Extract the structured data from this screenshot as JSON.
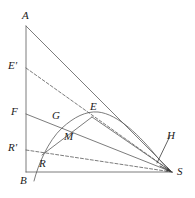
{
  "figure": {
    "type": "geometry-diagram",
    "title": "",
    "canvas": {
      "width": 195,
      "height": 198
    },
    "style": {
      "stroke_color": "#5a5a5a",
      "stroke_color_dark": "#3c3c3c",
      "label_color": "#1a1a1a",
      "background": "#ffffff",
      "stroke_width": 0.8,
      "dash_pattern": "3,2"
    },
    "points": [
      {
        "name": "A",
        "label": "A",
        "x": 26,
        "y": 26,
        "label_x": 22,
        "label_y": 10
      },
      {
        "name": "E'",
        "label": "E'",
        "x": 26,
        "y": 68,
        "label_x": 8,
        "label_y": 60
      },
      {
        "name": "F",
        "label": "F",
        "x": 26,
        "y": 114,
        "label_x": 11,
        "label_y": 106
      },
      {
        "name": "G",
        "label": "G",
        "x": 62,
        "y": 124,
        "label_x": 52,
        "label_y": 110
      },
      {
        "name": "E",
        "label": "E",
        "x": 92,
        "y": 117,
        "label_x": 90,
        "label_y": 101
      },
      {
        "name": "M",
        "label": "M",
        "x": 74,
        "y": 139,
        "label_x": 64,
        "label_y": 131
      },
      {
        "name": "R'",
        "label": "R'",
        "x": 26,
        "y": 150,
        "label_x": 8,
        "label_y": 142
      },
      {
        "name": "R",
        "label": "R",
        "x": 42,
        "y": 155,
        "label_x": 39,
        "label_y": 158
      },
      {
        "name": "B",
        "label": "B",
        "x": 26,
        "y": 172,
        "label_x": 20,
        "label_y": 175
      },
      {
        "name": "H",
        "label": "H",
        "x": 158,
        "y": 162,
        "label_x": 167,
        "label_y": 130
      },
      {
        "name": "S",
        "label": "S",
        "x": 172,
        "y": 172,
        "label_x": 177,
        "label_y": 166
      }
    ],
    "segments": [
      {
        "name": "segment-A-B",
        "from": "A",
        "to": "B",
        "style": "solid"
      },
      {
        "name": "segment-B-S",
        "from": "B",
        "to": "S",
        "style": "solid"
      },
      {
        "name": "segment-A-S",
        "from": "A",
        "to": "S",
        "style": "solid"
      },
      {
        "name": "segment-F-S",
        "from": "F",
        "to": "S",
        "style": "solid"
      },
      {
        "name": "segment-R-E",
        "from": "R",
        "to": "E",
        "style": "solid"
      },
      {
        "name": "segment-E-S",
        "from": "E",
        "to": "S",
        "style": "solid"
      },
      {
        "name": "segment-Eprime-S",
        "from": "E'",
        "to": "S",
        "style": "dashed"
      },
      {
        "name": "segment-Rprime-S",
        "from": "R'",
        "to": "S",
        "style": "dashed"
      },
      {
        "name": "leader-H-pointer",
        "from": "H-label",
        "to": "H",
        "style": "solid"
      }
    ],
    "curve": {
      "name": "parabolic-arc",
      "style": "solid",
      "description": "arc rising from below baseline through R and G to apex then descending to S",
      "path": "M 34,181 C 38,165 48,141 62,128 C 74,117 86,111 98,112 C 118,114 140,136 158,158 C 164,165 169,170 172,172"
    },
    "arrow_head": {
      "name": "arrowhead-at-S",
      "x": 172,
      "y": 172
    }
  }
}
